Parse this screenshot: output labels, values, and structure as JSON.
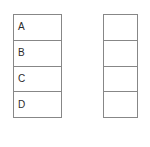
{
  "diagram": {
    "background_color": "#ffffff",
    "border_color": "#878787",
    "text_color": "#2b2b2b",
    "tables": [
      {
        "name": "left-table",
        "rows": [
          {
            "label": "A"
          },
          {
            "label": "B"
          },
          {
            "label": "C"
          },
          {
            "label": "D"
          }
        ]
      },
      {
        "name": "right-table",
        "rows": [
          {
            "label": ""
          },
          {
            "label": ""
          },
          {
            "label": ""
          },
          {
            "label": ""
          }
        ]
      }
    ]
  }
}
